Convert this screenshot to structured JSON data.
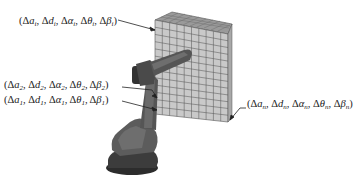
{
  "figure": {
    "labels": {
      "top": {
        "subscript": "i",
        "text": "(Δa_i, Δd_i, Δα_i, Δθ_i, Δβ_i)"
      },
      "joint2": {
        "subscript": "2",
        "text": "(Δa_2, Δd_2, Δα_2, Δθ_2, Δβ_2)"
      },
      "joint1": {
        "subscript": "1",
        "text": "(Δa_1, Δd_1, Δα_1, Δθ_1, Δβ_1)"
      },
      "last": {
        "subscript": "n",
        "text": "(Δa_n, Δd_n, Δα_n, Δθ_n, Δβ_n)"
      }
    },
    "symbols": {
      "delta": "Δ",
      "a": "a",
      "d": "d",
      "alpha": "α",
      "theta": "θ",
      "beta": "β"
    },
    "grid": {
      "columns": 10,
      "rows": 13
    },
    "colors": {
      "grid_face": "#c8c8c8",
      "grid_line": "#555555",
      "grid_top": "#9a9a9a",
      "robot_dark": "#3a3a3a",
      "robot_mid": "#5e5e5e",
      "robot_light": "#7a7a7a"
    }
  }
}
